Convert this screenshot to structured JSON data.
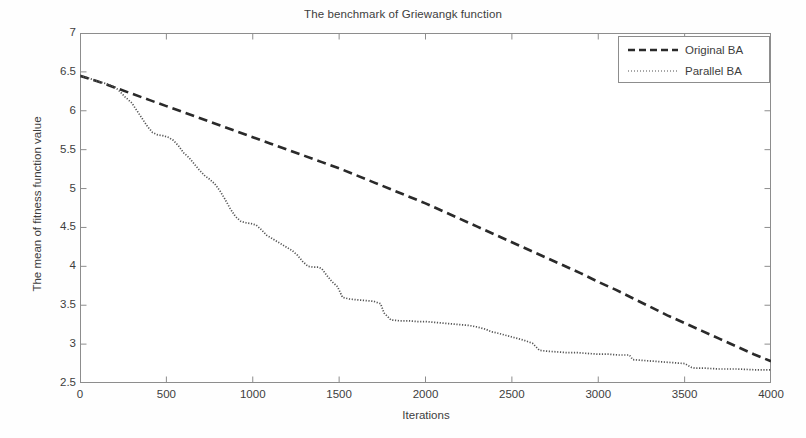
{
  "chart_data": {
    "type": "line",
    "title": "The benchmark of Griewangk function",
    "xlabel": "Iterations",
    "ylabel": "The mean of fitness function value",
    "xlim": [
      0,
      4000
    ],
    "ylim": [
      2.5,
      7
    ],
    "xticks": [
      0,
      500,
      1000,
      1500,
      2000,
      2500,
      3000,
      3500,
      4000
    ],
    "xtick_labels": [
      "0",
      "500",
      "1000",
      "1500",
      "2000",
      "2500",
      "3000",
      "3500",
      "4000"
    ],
    "yticks": [
      2.5,
      3,
      3.5,
      4,
      4.5,
      5,
      5.5,
      6,
      6.5,
      7
    ],
    "ytick_labels": [
      "2.5",
      "3",
      "3.5",
      "4",
      "4.5",
      "5",
      "5.5",
      "6",
      "6.5",
      "7"
    ],
    "grid": false,
    "legend_position": "top-right",
    "series": [
      {
        "name": "Original BA",
        "style": "dashed",
        "color": "#2a2a2a",
        "x": [
          0,
          100,
          200,
          300,
          400,
          500,
          600,
          700,
          800,
          900,
          1000,
          1100,
          1200,
          1300,
          1400,
          1500,
          1600,
          1700,
          1800,
          1900,
          2000,
          2100,
          2200,
          2300,
          2400,
          2500,
          2600,
          2700,
          2800,
          2900,
          3000,
          3100,
          3200,
          3300,
          3400,
          3500,
          3600,
          3700,
          3800,
          3900,
          4000
        ],
        "y": [
          6.45,
          6.38,
          6.3,
          6.22,
          6.14,
          6.06,
          5.98,
          5.9,
          5.82,
          5.74,
          5.66,
          5.58,
          5.5,
          5.42,
          5.34,
          5.26,
          5.17,
          5.08,
          4.99,
          4.9,
          4.81,
          4.71,
          4.61,
          4.51,
          4.41,
          4.31,
          4.21,
          4.11,
          4.01,
          3.91,
          3.8,
          3.7,
          3.59,
          3.48,
          3.37,
          3.27,
          3.17,
          3.07,
          2.97,
          2.87,
          2.78
        ]
      },
      {
        "name": "Parallel BA",
        "style": "dotted",
        "color": "#555555",
        "x": [
          0,
          50,
          100,
          150,
          200,
          230,
          260,
          300,
          330,
          360,
          390,
          420,
          450,
          480,
          510,
          540,
          570,
          600,
          630,
          660,
          690,
          720,
          750,
          780,
          810,
          840,
          870,
          900,
          930,
          960,
          990,
          1020,
          1050,
          1080,
          1110,
          1140,
          1170,
          1200,
          1230,
          1260,
          1290,
          1320,
          1350,
          1380,
          1400,
          1430,
          1460,
          1490,
          1520,
          1560,
          1600,
          1650,
          1700,
          1740,
          1760,
          1800,
          1850,
          1900,
          1950,
          2000,
          2050,
          2100,
          2150,
          2200,
          2250,
          2300,
          2350,
          2380,
          2420,
          2470,
          2520,
          2570,
          2620,
          2660,
          2700,
          2760,
          2820,
          2880,
          2940,
          3000,
          3060,
          3120,
          3180,
          3200,
          3260,
          3320,
          3380,
          3440,
          3500,
          3540,
          3560,
          3620,
          3700,
          3800,
          3900,
          4000
        ],
        "y": [
          6.45,
          6.42,
          6.38,
          6.35,
          6.31,
          6.25,
          6.18,
          6.1,
          6.0,
          5.9,
          5.8,
          5.72,
          5.69,
          5.68,
          5.66,
          5.62,
          5.55,
          5.46,
          5.4,
          5.32,
          5.24,
          5.17,
          5.12,
          5.06,
          4.97,
          4.86,
          4.74,
          4.64,
          4.58,
          4.56,
          4.55,
          4.53,
          4.47,
          4.4,
          4.36,
          4.32,
          4.28,
          4.24,
          4.2,
          4.14,
          4.06,
          4.0,
          3.99,
          3.99,
          3.97,
          3.88,
          3.8,
          3.74,
          3.6,
          3.58,
          3.57,
          3.56,
          3.55,
          3.52,
          3.4,
          3.31,
          3.3,
          3.3,
          3.29,
          3.29,
          3.28,
          3.27,
          3.26,
          3.25,
          3.24,
          3.22,
          3.19,
          3.16,
          3.14,
          3.11,
          3.08,
          3.05,
          3.01,
          2.92,
          2.91,
          2.9,
          2.89,
          2.89,
          2.88,
          2.87,
          2.87,
          2.86,
          2.86,
          2.8,
          2.79,
          2.78,
          2.77,
          2.76,
          2.75,
          2.7,
          2.69,
          2.69,
          2.68,
          2.68,
          2.67,
          2.67
        ]
      }
    ]
  }
}
